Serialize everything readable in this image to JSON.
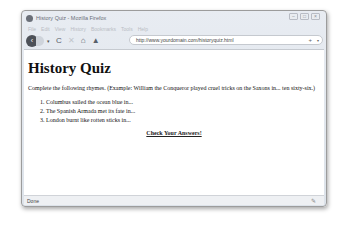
{
  "window": {
    "title": "History Quiz - Mozilla Firefox",
    "controls": {
      "minimize": "–",
      "maximize": "□",
      "close": "×"
    }
  },
  "menubar": {
    "items": [
      "File",
      "Edit",
      "View",
      "History",
      "Bookmarks",
      "Tools",
      "Help"
    ]
  },
  "navbar": {
    "back_icon": "‹",
    "dropdown_icon": "▾",
    "reload_icon": "C",
    "stop_icon": "✕",
    "home_icon": "⌂",
    "feed_icon": "▲",
    "url": "http://www.yourdomain.com/historyquiz.html",
    "bookmark_icon": "+",
    "url_dropdown_icon": "▾"
  },
  "page": {
    "title": "History Quiz",
    "intro": "Complete the following rhymes. (Example: William the Conqueror played cruel tricks on the Saxons in... ten sixty-six.)",
    "rhymes": [
      "Columbus sailed the ocean blue in...",
      "The Spanish Armada met its fate in...",
      "London burnt like rotten sticks in..."
    ],
    "check_link": "Check Your Answers!"
  },
  "statusbar": {
    "text": "Done",
    "icon": "✎"
  }
}
